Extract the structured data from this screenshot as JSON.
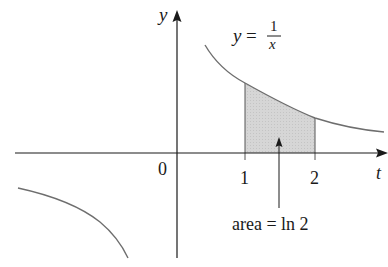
{
  "diagram": {
    "function_label": {
      "lhs": "y",
      "eq": "=",
      "numerator": "1",
      "denominator": "x"
    },
    "axes": {
      "x_label": "t",
      "y_label": "y",
      "origin_label": "0",
      "x_ticks": [
        "1",
        "2"
      ]
    },
    "annotation": "area = ln 2",
    "shaded_region": {
      "from": 1,
      "to": 2,
      "fill": "#d4d4d4"
    },
    "colors": {
      "curve": "#6e6e6e",
      "axis": "#1a1a1a",
      "shade": "#d4d4d4",
      "background": "#ffffff"
    }
  }
}
